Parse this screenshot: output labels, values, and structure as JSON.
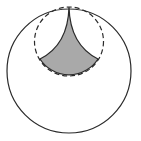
{
  "diagram": {
    "type": "geometry-figure",
    "colors": {
      "background": "#ffffff",
      "stroke": "#2a2a2a",
      "shade": "#a9a9a9"
    },
    "large_circle": {
      "cx": 69,
      "cy": 71,
      "r": 62
    },
    "small_circle": {
      "cx": 69,
      "cy": 41.5,
      "r": 34.5,
      "style": "dashed"
    },
    "tangent_point": {
      "x": 69,
      "y": 7
    }
  }
}
